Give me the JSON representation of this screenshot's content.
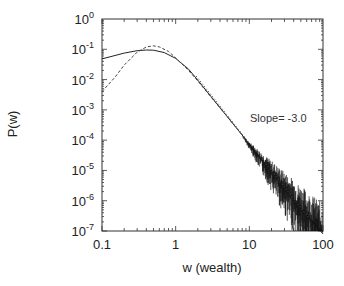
{
  "chart_data": {
    "type": "line",
    "title": "",
    "xlabel": "w (wealth)",
    "ylabel": "P(w)",
    "xscale": "log",
    "yscale": "log",
    "xlim": [
      0.1,
      100
    ],
    "ylim": [
      1e-07,
      1
    ],
    "grid": false,
    "legend": null,
    "x_ticks": [
      "0.1",
      "1",
      "10",
      "100"
    ],
    "y_ticks": [
      {
        "base": "10",
        "exp": "0"
      },
      {
        "base": "10",
        "exp": "-1"
      },
      {
        "base": "10",
        "exp": "-2"
      },
      {
        "base": "10",
        "exp": "-3"
      },
      {
        "base": "10",
        "exp": "-4"
      },
      {
        "base": "10",
        "exp": "-5"
      },
      {
        "base": "10",
        "exp": "-6"
      },
      {
        "base": "10",
        "exp": "-7"
      }
    ],
    "series": [
      {
        "name": "simulation (solid, noisy tail)",
        "style": "solid",
        "x": [
          0.1,
          0.2,
          0.3,
          0.4,
          0.5,
          0.7,
          1.0,
          1.5,
          2,
          3,
          5,
          7,
          10,
          15,
          20,
          30,
          50,
          70,
          100
        ],
        "y": [
          0.048,
          0.075,
          0.09,
          0.095,
          0.093,
          0.078,
          0.05,
          0.022,
          0.0095,
          0.0028,
          0.0006,
          0.00022,
          7.5e-05,
          2.2e-05,
          9.5e-06,
          2.8e-06,
          6e-07,
          2.2e-07,
          8e-08
        ]
      },
      {
        "name": "fit (dashed)",
        "style": "dashed",
        "x": [
          0.1,
          0.15,
          0.2,
          0.3,
          0.4,
          0.5,
          0.6,
          0.8,
          1.0,
          1.5,
          2,
          3,
          5,
          10
        ],
        "y": [
          0.004,
          0.012,
          0.03,
          0.08,
          0.12,
          0.13,
          0.12,
          0.085,
          0.052,
          0.02,
          0.009,
          0.0027,
          0.0006,
          7.5e-05
        ]
      },
      {
        "name": "reference power law",
        "style": "dotted",
        "x": [
          1.9,
          66
        ],
        "y": [
          0.013,
          2.5e-07
        ]
      }
    ],
    "annotations": [
      {
        "text": "Slope= -3.0",
        "x": 12,
        "y": 0.0002
      }
    ]
  }
}
